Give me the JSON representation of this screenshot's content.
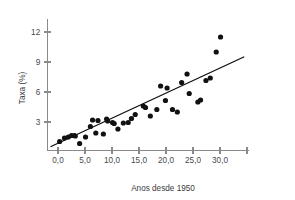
{
  "chart_data": {
    "type": "scatter",
    "title": "",
    "xlabel": "Anos desde 1950",
    "ylabel": "Taxa (%)",
    "xlim": [
      -2.5,
      36.0
    ],
    "ylim": [
      0.0,
      13.4
    ],
    "grid": false,
    "legend": null,
    "x_ticks": [
      0,
      5,
      10,
      15,
      20,
      25,
      30,
      35
    ],
    "x_tick_labels": [
      "0,0",
      "5,0",
      "10,0",
      "15,0",
      "20,0",
      "25,0",
      "30,0",
      ""
    ],
    "y_ticks": [
      3,
      6,
      9,
      12
    ],
    "y_tick_labels": [
      "3",
      "6",
      "9",
      "12"
    ],
    "point_color": "#111111",
    "line_color": "#111111",
    "axis_color": "#8a8a8a",
    "marker_radius": 2.6,
    "x": [
      0.3,
      1.2,
      1.9,
      2.5,
      3.0,
      3.2,
      4.0,
      5.1,
      6.0,
      6.4,
      7.0,
      7.4,
      8.4,
      9.0,
      9.2,
      10.1,
      10.4,
      11.1,
      12.1,
      13.0,
      13.6,
      14.3,
      15.8,
      16.2,
      17.1,
      18.3,
      19.0,
      19.9,
      20.2,
      21.2,
      22.1,
      22.9,
      23.9,
      24.3,
      25.9,
      26.4,
      27.4,
      28.2,
      29.3,
      30.1
    ],
    "y": [
      1.05,
      1.4,
      1.5,
      1.65,
      1.65,
      1.6,
      0.85,
      1.5,
      2.55,
      3.2,
      1.9,
      3.15,
      1.8,
      3.3,
      3.1,
      2.95,
      2.85,
      2.3,
      2.9,
      2.95,
      3.35,
      3.75,
      4.6,
      4.45,
      3.6,
      4.25,
      6.6,
      5.15,
      6.4,
      4.25,
      4.0,
      6.95,
      7.8,
      5.85,
      5.0,
      5.2,
      7.15,
      7.4,
      10.0,
      11.5
    ],
    "trend_line": {
      "x0": -1.3,
      "y0": 0.55,
      "x1": 34.4,
      "y1": 9.5,
      "description": "linear regression fit"
    },
    "n_points": 40
  },
  "figure": {
    "background_color": "#ffffff",
    "width": 295,
    "height": 200
  }
}
